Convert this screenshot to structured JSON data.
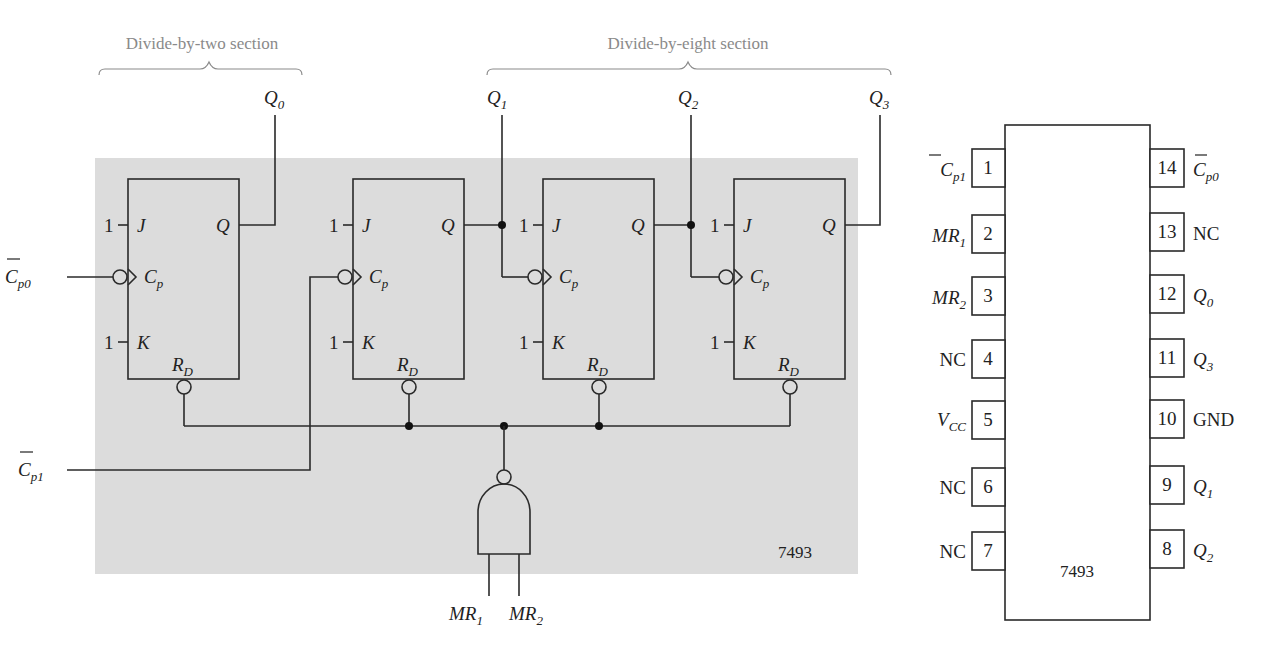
{
  "figure": {
    "part_number": "7493",
    "sections": [
      {
        "label": "Divide-by-two section"
      },
      {
        "label": "Divide-by-eight section"
      }
    ],
    "outputs": [
      {
        "name": "Q",
        "sub": "0"
      },
      {
        "name": "Q",
        "sub": "1"
      },
      {
        "name": "Q",
        "sub": "2"
      },
      {
        "name": "Q",
        "sub": "3"
      }
    ],
    "clock_inputs": [
      {
        "name": "C",
        "sub": "p0",
        "overbar": true
      },
      {
        "name": "C",
        "sub": "p1",
        "overbar": true
      }
    ],
    "reset_inputs": [
      {
        "name": "MR",
        "sub": "1"
      },
      {
        "name": "MR",
        "sub": "2"
      }
    ],
    "flip_flop": {
      "j_label": "J",
      "k_label": "K",
      "q_label": "Q",
      "clock_label": "C",
      "clock_sub": "p",
      "reset_label": "R",
      "reset_sub": "D",
      "tie_high": "1"
    },
    "colors": {
      "background_panel": "#dcdcdc",
      "line": "#2a2a2a",
      "section_text": "#8a8a8a"
    }
  },
  "pinout": {
    "chip_label": "7493",
    "left_pins": [
      {
        "number": "1",
        "name": "C",
        "sub": "p1",
        "overbar": true,
        "italic": true
      },
      {
        "number": "2",
        "name": "MR",
        "sub": "1",
        "italic": true
      },
      {
        "number": "3",
        "name": "MR",
        "sub": "2",
        "italic": true
      },
      {
        "number": "4",
        "name": "NC",
        "sub": "",
        "italic": false
      },
      {
        "number": "5",
        "name": "V",
        "sub": "CC",
        "italic": true
      },
      {
        "number": "6",
        "name": "NC",
        "sub": "",
        "italic": false
      },
      {
        "number": "7",
        "name": "NC",
        "sub": "",
        "italic": false
      }
    ],
    "right_pins": [
      {
        "number": "14",
        "name": "C",
        "sub": "p0",
        "overbar": true,
        "italic": true
      },
      {
        "number": "13",
        "name": "NC",
        "sub": "",
        "italic": false
      },
      {
        "number": "12",
        "name": "Q",
        "sub": "0",
        "italic": true
      },
      {
        "number": "11",
        "name": "Q",
        "sub": "3",
        "italic": true
      },
      {
        "number": "10",
        "name": "GND",
        "sub": "",
        "italic": false
      },
      {
        "number": "9",
        "name": "Q",
        "sub": "1",
        "italic": true
      },
      {
        "number": "8",
        "name": "Q",
        "sub": "2",
        "italic": true
      }
    ]
  }
}
